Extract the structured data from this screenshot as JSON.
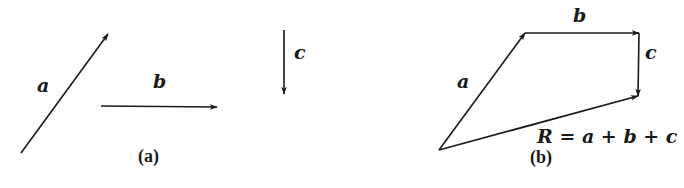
{
  "colors": {
    "stroke": "#1a1a1a",
    "background": "#ffffff"
  },
  "panel_a": {
    "caption": "(a)",
    "vectors": [
      {
        "name": "a",
        "label": "a",
        "from": [
          21,
          153
        ],
        "to": [
          108,
          34
        ]
      },
      {
        "name": "b",
        "label": "b",
        "from": [
          101,
          106
        ],
        "to": [
          217,
          107
        ]
      },
      {
        "name": "c",
        "label": "c",
        "from": [
          284,
          30
        ],
        "to": [
          284,
          94
        ]
      }
    ]
  },
  "panel_b": {
    "caption": "(b)",
    "vectors": [
      {
        "name": "a",
        "label": "a",
        "from": [
          439,
          150
        ],
        "to": [
          525,
          33
        ]
      },
      {
        "name": "b",
        "label": "b",
        "from": [
          525,
          33
        ],
        "to": [
          639,
          33
        ]
      },
      {
        "name": "c",
        "label": "c",
        "from": [
          639,
          33
        ],
        "to": [
          638,
          96
        ]
      },
      {
        "name": "R",
        "label": "R = a + b + c",
        "from": [
          439,
          150
        ],
        "to": [
          638,
          96
        ]
      }
    ],
    "resultant_equation": "R = a + b + c"
  }
}
